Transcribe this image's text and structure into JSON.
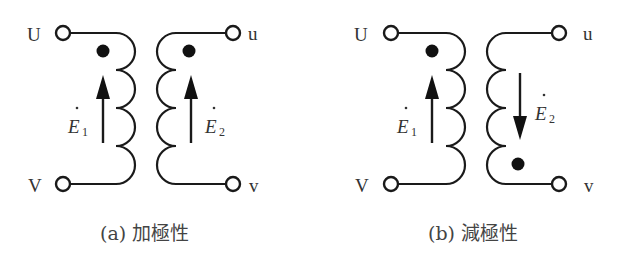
{
  "diagram": {
    "panels": [
      {
        "id": "a",
        "caption": "(a) 加極性",
        "primary": {
          "terminal_top_label": "U",
          "terminal_bottom_label": "V",
          "emf_label": "E",
          "emf_subscript": "1",
          "arrow_direction": "up",
          "polarity_dot": "top"
        },
        "secondary": {
          "terminal_top_label": "u",
          "terminal_bottom_label": "v",
          "emf_label": "E",
          "emf_subscript": "2",
          "arrow_direction": "up",
          "polarity_dot": "top"
        }
      },
      {
        "id": "b",
        "caption": "(b) 減極性",
        "primary": {
          "terminal_top_label": "U",
          "terminal_bottom_label": "V",
          "emf_label": "E",
          "emf_subscript": "1",
          "arrow_direction": "up",
          "polarity_dot": "top"
        },
        "secondary": {
          "terminal_top_label": "u",
          "terminal_bottom_label": "v",
          "emf_label": "E",
          "emf_subscript": "2",
          "arrow_direction": "down",
          "polarity_dot": "bottom"
        }
      }
    ],
    "colors": {
      "line": "#1a1a1a",
      "text": "#333333",
      "background": "#ffffff"
    }
  }
}
